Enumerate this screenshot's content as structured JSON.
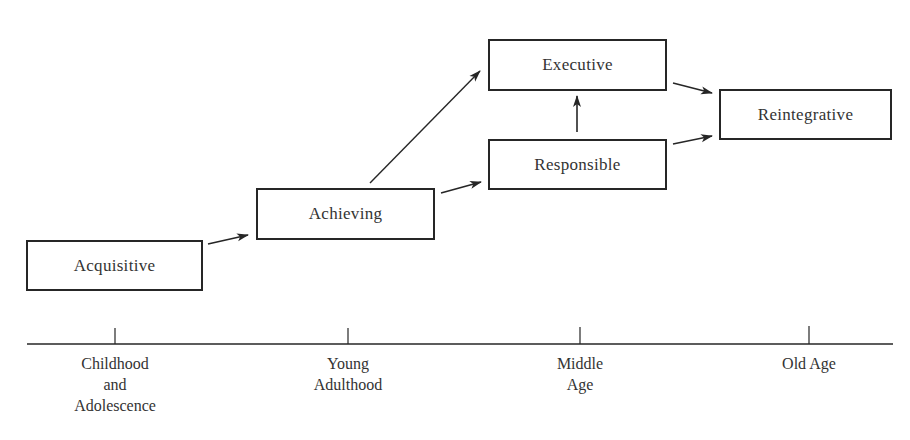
{
  "diagram": {
    "stages": [
      {
        "id": "acquisitive",
        "label": "Acquisitive",
        "x": 26,
        "y": 240,
        "w": 177,
        "h": 51
      },
      {
        "id": "achieving",
        "label": "Achieving",
        "x": 256,
        "y": 188,
        "w": 179,
        "h": 52
      },
      {
        "id": "executive",
        "label": "Executive",
        "x": 488,
        "y": 39,
        "w": 179,
        "h": 52
      },
      {
        "id": "responsible",
        "label": "Responsible",
        "x": 488,
        "y": 139,
        "w": 179,
        "h": 51
      },
      {
        "id": "reintegrative",
        "label": "Reintegrative",
        "x": 719,
        "y": 89,
        "w": 173,
        "h": 51
      }
    ],
    "arrows": [
      {
        "from": "acquisitive",
        "to": "achieving"
      },
      {
        "from": "achieving",
        "to": "executive"
      },
      {
        "from": "achieving",
        "to": "responsible"
      },
      {
        "from": "responsible",
        "to": "executive"
      },
      {
        "from": "executive",
        "to": "reintegrative"
      },
      {
        "from": "responsible",
        "to": "reintegrative"
      }
    ],
    "timeline": {
      "periods": [
        {
          "line1": "Childhood",
          "line2": "and",
          "line3": "Adolescence",
          "x": 115
        },
        {
          "line1": "Young",
          "line2": "Adulthood",
          "line3": "",
          "x": 348
        },
        {
          "line1": "Middle",
          "line2": "Age",
          "line3": "",
          "x": 580
        },
        {
          "line1": "Old Age",
          "line2": "",
          "line3": "",
          "x": 809
        }
      ]
    },
    "colors": {
      "stroke": "#262626",
      "text": "#333333",
      "background": "#ffffff"
    }
  }
}
